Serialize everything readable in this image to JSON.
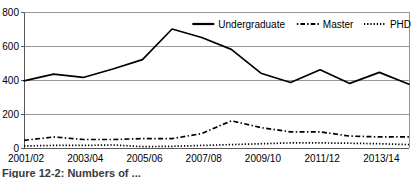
{
  "chart_data": {
    "type": "line",
    "title": "",
    "subtitle": "",
    "xlabel": "",
    "ylabel": "",
    "ylim": [
      0,
      800
    ],
    "ytick_values": [
      0,
      200,
      400,
      600,
      800
    ],
    "ytick_labels": [
      "0",
      "200",
      "400",
      "600",
      "800"
    ],
    "grid": true,
    "grid_axis": "y",
    "legend_position": "top-right",
    "x": [
      "2001/02",
      "2002/03",
      "2003/04",
      "2004/05",
      "2005/06",
      "2006/07",
      "2007/08",
      "2008/09",
      "2009/10",
      "2010/11",
      "2011/12",
      "2012/13",
      "2013/14",
      "2014/15"
    ],
    "xtick_labels": [
      "2001/02",
      "2003/04",
      "2005/06",
      "2007/08",
      "2009/10",
      "2011/12",
      "2013/14"
    ],
    "xtick_indices": [
      0,
      2,
      4,
      6,
      8,
      10,
      12
    ],
    "series": [
      {
        "name": "Undergraduate",
        "style": "solid",
        "values": [
          395,
          435,
          415,
          465,
          520,
          700,
          650,
          580,
          440,
          385,
          460,
          380,
          445,
          375
        ]
      },
      {
        "name": "Master",
        "style": "dash-dot",
        "values": [
          45,
          65,
          50,
          50,
          55,
          55,
          85,
          160,
          120,
          95,
          95,
          70,
          65,
          65
        ]
      },
      {
        "name": "PHD",
        "style": "dotted",
        "values": [
          12,
          15,
          15,
          18,
          8,
          10,
          15,
          20,
          25,
          30,
          30,
          28,
          25,
          20
        ]
      }
    ]
  },
  "legend": {
    "entries": [
      {
        "label": "Undergraduate",
        "style": "solid"
      },
      {
        "label": "Master",
        "style": "dash-dot"
      },
      {
        "label": "PHD",
        "style": "dotted"
      }
    ]
  },
  "caption": {
    "text": "Figure 12-2: Numbers of ..."
  }
}
